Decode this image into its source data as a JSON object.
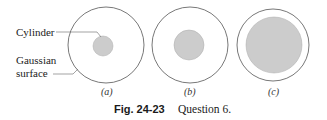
{
  "figure": {
    "labels": {
      "cylinder": "Cylinder",
      "gaussian_line1": "Gaussian",
      "gaussian_line2": "surface"
    },
    "panels": [
      {
        "id": "a",
        "label": "(a)",
        "outer": {
          "cx": 106,
          "cy": 45,
          "r": 38
        },
        "inner": {
          "cx": 103,
          "cy": 46,
          "r": 10
        }
      },
      {
        "id": "b",
        "label": "(b)",
        "outer": {
          "cx": 190,
          "cy": 45,
          "r": 38
        },
        "inner": {
          "cx": 189,
          "cy": 45,
          "r": 15
        }
      },
      {
        "id": "c",
        "label": "(c)",
        "outer": {
          "cx": 273,
          "cy": 45,
          "r": 36
        },
        "inner": {
          "cx": 274,
          "cy": 45,
          "r": 28
        }
      }
    ],
    "caption": {
      "figure_number": "Fig. 24-23",
      "text": "Question 6."
    },
    "colors": {
      "outline": "#555555",
      "fill": "#cccccc",
      "leader": "#666666"
    }
  }
}
